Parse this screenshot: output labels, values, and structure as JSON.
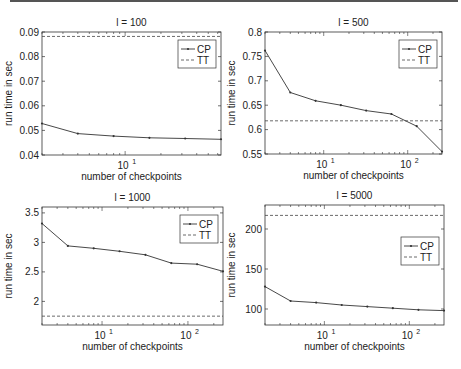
{
  "chart_data": [
    {
      "type": "line",
      "title": "l = 100",
      "xlabel": "number of checkpoints",
      "ylabel": "run time in sec",
      "xscale": "log",
      "xlim": [
        2,
        64
      ],
      "ylim": [
        0.04,
        0.09
      ],
      "yticks": [
        "0.04",
        "0.05",
        "0.06",
        "0.07",
        "0.08",
        "0.09"
      ],
      "yticks_values": [
        0.04,
        0.05,
        0.06,
        0.07,
        0.08,
        0.09
      ],
      "xticks": [
        {
          "value": 10,
          "base": "10",
          "exp": "1"
        }
      ],
      "legend_position": "upper right",
      "x": [
        2,
        4,
        8,
        16,
        32,
        64
      ],
      "series": [
        {
          "name": "CP",
          "style": "solid-marker",
          "values": [
            0.0528,
            0.0487,
            0.0477,
            0.047,
            0.0467,
            0.0464
          ]
        },
        {
          "name": "TT",
          "style": "dashed",
          "constant": 0.0882
        }
      ],
      "frame": {
        "x": 42,
        "y": 32,
        "w": 179,
        "h": 123
      }
    },
    {
      "type": "line",
      "title": "l = 500",
      "xlabel": "number of checkpoints",
      "ylabel": "run time in sec",
      "xscale": "log",
      "xlim": [
        2,
        256
      ],
      "ylim": [
        0.55,
        0.8
      ],
      "yticks": [
        "0.55",
        "0.6",
        "0.65",
        "0.7",
        "0.75",
        "0.8"
      ],
      "yticks_values": [
        0.55,
        0.6,
        0.65,
        0.7,
        0.75,
        0.8
      ],
      "xticks": [
        {
          "value": 10,
          "base": "10",
          "exp": "1"
        },
        {
          "value": 100,
          "base": "10",
          "exp": "2"
        }
      ],
      "legend_position": "upper right",
      "x": [
        2,
        4,
        8,
        16,
        32,
        64,
        128,
        256
      ],
      "series": [
        {
          "name": "CP",
          "style": "solid-marker",
          "values": [
            0.762,
            0.676,
            0.659,
            0.65,
            0.639,
            0.632,
            0.607,
            0.555
          ]
        },
        {
          "name": "TT",
          "style": "dashed",
          "constant": 0.618
        }
      ],
      "frame": {
        "x": 265,
        "y": 32,
        "w": 177,
        "h": 122
      }
    },
    {
      "type": "line",
      "title": "l = 1000",
      "xlabel": "number of checkpoints",
      "ylabel": "run time in sec",
      "xscale": "log",
      "xlim": [
        2,
        256
      ],
      "ylim": [
        1.6,
        3.6
      ],
      "yticks": [
        "2",
        "2.5",
        "3",
        "3.5"
      ],
      "yticks_values": [
        2,
        2.5,
        3,
        3.5
      ],
      "xticks": [
        {
          "value": 10,
          "base": "10",
          "exp": "1"
        },
        {
          "value": 100,
          "base": "10",
          "exp": "2"
        }
      ],
      "legend_position": "upper right",
      "x": [
        2,
        4,
        8,
        16,
        32,
        64,
        128,
        256
      ],
      "series": [
        {
          "name": "CP",
          "style": "solid-marker",
          "values": [
            3.32,
            2.94,
            2.9,
            2.85,
            2.79,
            2.65,
            2.63,
            2.51
          ]
        },
        {
          "name": "TT",
          "style": "dashed",
          "constant": 1.75
        }
      ],
      "frame": {
        "x": 42,
        "y": 207,
        "w": 181,
        "h": 118
      }
    },
    {
      "type": "line",
      "title": "l = 5000",
      "xlabel": "number of checkpoints",
      "ylabel": "run time in sec",
      "xscale": "log",
      "xlim": [
        2,
        256
      ],
      "ylim": [
        80,
        230
      ],
      "yticks": [
        "100",
        "150",
        "200"
      ],
      "yticks_values": [
        100,
        150,
        200
      ],
      "xticks": [
        {
          "value": 10,
          "base": "10",
          "exp": "1"
        },
        {
          "value": 100,
          "base": "10",
          "exp": "2"
        }
      ],
      "legend_position": "upper right",
      "x": [
        2,
        4,
        8,
        16,
        32,
        64,
        128,
        256
      ],
      "series": [
        {
          "name": "CP",
          "style": "solid-marker",
          "values": [
            128,
            110,
            108,
            105,
            103,
            101,
            99,
            98
          ]
        },
        {
          "name": "TT",
          "style": "dashed",
          "constant": 217
        }
      ],
      "frame": {
        "x": 265,
        "y": 205,
        "w": 179,
        "h": 120
      }
    }
  ]
}
